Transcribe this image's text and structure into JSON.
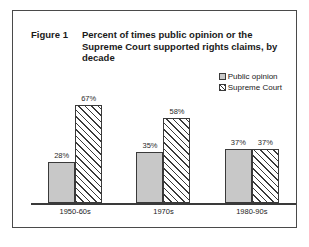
{
  "figure": {
    "number_label": "Figure 1",
    "title": "Percent of times public opinion or the Supreme Court supported rights claims, by decade"
  },
  "legend": {
    "items": [
      {
        "label": "Public opinion",
        "swatch": "solid-gray-swatch",
        "color": "#c8c8c8"
      },
      {
        "label": "Supreme Court",
        "swatch": "hatched-swatch",
        "color": "#ffffff"
      }
    ]
  },
  "chart_data": {
    "type": "bar",
    "title": "Percent of times public opinion or the Supreme Court supported rights claims, by decade",
    "xlabel": "",
    "ylabel": "",
    "ylim": [
      0,
      75
    ],
    "grid": false,
    "legend_position": "top-right",
    "categories": [
      "1950-60s",
      "1970s",
      "1980-90s"
    ],
    "series": [
      {
        "name": "Public opinion",
        "color": "#c8c8c8",
        "fill": "solid",
        "values": [
          28,
          35,
          37
        ],
        "labels": [
          "28%",
          "35%",
          "37%"
        ]
      },
      {
        "name": "Supreme Court",
        "color": "#ffffff",
        "fill": "diagonal-hatch",
        "values": [
          67,
          58,
          37
        ],
        "labels": [
          "67%",
          "58%",
          "37%"
        ]
      }
    ]
  }
}
